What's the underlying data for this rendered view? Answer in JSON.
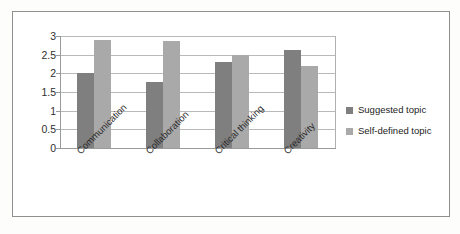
{
  "chart_data": {
    "type": "bar",
    "title": "",
    "xlabel": "",
    "ylabel": "",
    "categories": [
      "Communication",
      "Collaboration",
      "Critical thinking",
      "Creativity"
    ],
    "series": [
      {
        "name": "Suggested topic",
        "color": "#7f7f7f",
        "values": [
          2.0,
          1.77,
          2.3,
          2.63
        ]
      },
      {
        "name": "Self-defined topic",
        "color": "#a9a9a9",
        "values": [
          2.9,
          2.87,
          2.5,
          2.2
        ]
      }
    ],
    "ylim": [
      0,
      3
    ],
    "yticks": [
      "0",
      "0.5",
      "1",
      "1.5",
      "2",
      "2.5",
      "3"
    ],
    "ytick_values": [
      0,
      0.5,
      1,
      1.5,
      2,
      2.5,
      3
    ],
    "grid": true,
    "legend_position": "right"
  },
  "frame": {
    "border_color": "#8f8f8f",
    "background": "#ffffff"
  },
  "axis": {
    "line_color": "#9a9a9a",
    "gridline_color": "#b9b9b9"
  }
}
